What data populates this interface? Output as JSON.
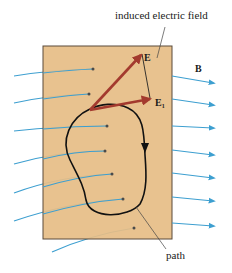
{
  "diagram": {
    "labels": {
      "induced_field": "induced electric field",
      "E": "E",
      "E1_base": "E",
      "E1_sub": "1",
      "B": "B",
      "path": "path"
    },
    "colors": {
      "plate_fill": "#e6bd86",
      "plate_border": "#5a4a3a",
      "field_line": "#3d9fd0",
      "vector": "#a33a2e",
      "path": "#111111"
    }
  }
}
